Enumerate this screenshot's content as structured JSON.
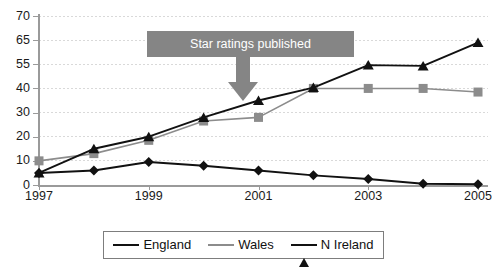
{
  "chart_data": {
    "type": "line",
    "title": "",
    "subtitle": "",
    "xlabel": "",
    "ylabel": "",
    "x": [
      1997,
      1998,
      1999,
      2000,
      2001,
      2002,
      2003,
      2004,
      2005
    ],
    "x_tick_labels": [
      "1997",
      "1999",
      "2001",
      "2003",
      "2005"
    ],
    "x_tick_values": [
      1997,
      1999,
      2001,
      2003,
      2005
    ],
    "xlim": [
      1997,
      2005
    ],
    "y_tick_labels": [
      "0",
      "10",
      "20",
      "30",
      "40",
      "55",
      "65",
      "70"
    ],
    "y_tick_values": [
      0,
      10,
      20,
      30,
      40,
      55,
      65,
      70
    ],
    "ylim": [
      0,
      70
    ],
    "y_axis_note": "non-linear: ticks evenly spaced at 0,10,20,30,40,55,65,70",
    "grid": true,
    "grid_axis": "y",
    "legend_position": "bottom",
    "series": [
      {
        "name": "England",
        "marker": "diamond",
        "color": "#111111",
        "values": [
          5,
          6,
          9.5,
          8,
          6,
          4,
          2.5,
          0.5,
          0.3
        ]
      },
      {
        "name": "Wales",
        "marker": "square",
        "color": "#8c8c8c",
        "values": [
          10,
          13,
          18.5,
          26.5,
          28,
          40,
          40,
          40,
          38.5
        ]
      },
      {
        "name": "N Ireland",
        "marker": "triangle",
        "color": "#111111",
        "values": [
          5,
          15,
          20,
          28,
          35,
          40.5,
          54.5,
          54,
          64
        ]
      }
    ],
    "annotations": [
      {
        "label": "Star ratings published",
        "points_to_x": 2001,
        "shape": "banner-with-down-arrow",
        "color": "#858585",
        "text_color": "#ffffff"
      }
    ]
  },
  "legend": {
    "items": [
      {
        "label": "England"
      },
      {
        "label": "Wales"
      },
      {
        "label": "N Ireland"
      }
    ]
  }
}
